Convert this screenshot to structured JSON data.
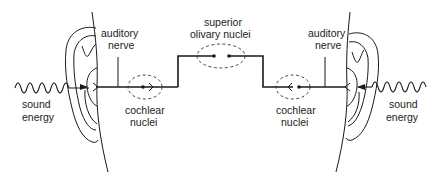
{
  "diagram": {
    "type": "auditory-pathway",
    "colors": {
      "line": "#1a1a1a",
      "text": "#222222",
      "background": "#ffffff"
    },
    "labels": {
      "left_sound_line1": "sound",
      "left_sound_line2": "energy",
      "left_nerve_line1": "auditory",
      "left_nerve_line2": "nerve",
      "left_cochlear_line1": "cochlear",
      "left_cochlear_line2": "nuclei",
      "olivary_line1": "superior",
      "olivary_line2": "olivary nuclei",
      "right_nerve_line1": "auditory",
      "right_nerve_line2": "nerve",
      "right_cochlear_line1": "cochlear",
      "right_cochlear_line2": "nuclei",
      "right_sound_line1": "sound",
      "right_sound_line2": "energy"
    },
    "nodes": [
      {
        "id": "left-ear",
        "label": "ear"
      },
      {
        "id": "left-cochlear-nuclei",
        "label": "cochlear nuclei"
      },
      {
        "id": "superior-olivary-nuclei",
        "label": "superior olivary nuclei"
      },
      {
        "id": "right-cochlear-nuclei",
        "label": "cochlear nuclei"
      },
      {
        "id": "right-ear",
        "label": "ear"
      }
    ],
    "edges": [
      {
        "from": "sound energy",
        "to": "left-ear"
      },
      {
        "from": "left-ear",
        "to": "left-cochlear-nuclei",
        "via": "auditory nerve"
      },
      {
        "from": "left-cochlear-nuclei",
        "to": "superior-olivary-nuclei"
      },
      {
        "from": "right-cochlear-nuclei",
        "to": "superior-olivary-nuclei"
      },
      {
        "from": "right-ear",
        "to": "right-cochlear-nuclei",
        "via": "auditory nerve"
      },
      {
        "from": "sound energy",
        "to": "right-ear"
      }
    ]
  }
}
